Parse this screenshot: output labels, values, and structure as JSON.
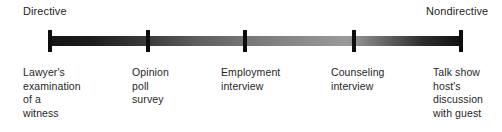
{
  "figure": {
    "type": "continuum-scale-diagram",
    "background_color": "#ffffff",
    "bar": {
      "gradient_from": "#141414",
      "gradient_mid": "#9a9a9a",
      "gradient_to": "#101010",
      "tick_color": "#0d0d0d"
    }
  },
  "endpoints": {
    "left": "Directive",
    "right": "Nondirective"
  },
  "scale_points": [
    {
      "label": "Lawyer's\nexamination\nof a\nwitness",
      "position_px": 50
    },
    {
      "label": "Opinion\npoll\nsurvey",
      "position_px": 148
    },
    {
      "label": "Employment\ninterview",
      "position_px": 245
    },
    {
      "label": "Counseling\ninterview",
      "position_px": 354
    },
    {
      "label": "Talk show\nhost's\ndiscussion\nwith guest",
      "position_px": 461
    }
  ],
  "label_left_px": [
    23,
    132,
    221,
    331,
    433
  ]
}
